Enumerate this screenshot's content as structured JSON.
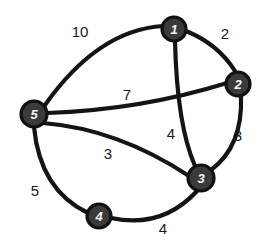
{
  "figure": {
    "background_color": "#ffffff",
    "node_fill_color": "#3a3a3a",
    "node_text_color": "#f2f2f2",
    "edge_color": "#141414",
    "label_color": "#1a1a1a"
  },
  "chart_data": {
    "type": "diagram",
    "title": "",
    "nodes": [
      {
        "id": "1",
        "label": "1",
        "x": 174,
        "y": 29,
        "r": 12
      },
      {
        "id": "2",
        "label": "2",
        "x": 238,
        "y": 84,
        "r": 12
      },
      {
        "id": "3",
        "label": "3",
        "x": 201,
        "y": 178,
        "r": 13
      },
      {
        "id": "4",
        "label": "4",
        "x": 99,
        "y": 216,
        "r": 12
      },
      {
        "id": "5",
        "label": "5",
        "x": 34,
        "y": 114,
        "r": 13
      }
    ],
    "edges": [
      {
        "id": "e-5-1",
        "source": "5",
        "target": "1",
        "weight": "10",
        "label_x": 80,
        "label_y": 31,
        "path": "M 45 105 Q 98 30 163 26"
      },
      {
        "id": "e-1-2",
        "source": "1",
        "target": "2",
        "weight": "2",
        "label_x": 225,
        "label_y": 33,
        "path": "M 186 31 Q 218 44 235 71"
      },
      {
        "id": "e-2-3",
        "source": "2",
        "target": "3",
        "weight": "3",
        "label_x": 238,
        "label_y": 135,
        "path": "M 241 96 Q 243 146 211 170"
      },
      {
        "id": "e-1-3",
        "source": "1",
        "target": "3",
        "weight": "4",
        "label_x": 171,
        "label_y": 133,
        "path": "M 175 41 Q 177 125 195 166"
      },
      {
        "id": "e-5-2",
        "source": "5",
        "target": "2",
        "weight": "7",
        "label_x": 127,
        "label_y": 94,
        "path": "M 47 113 Q 140 110 227 83"
      },
      {
        "id": "e-5-3",
        "source": "5",
        "target": "3",
        "weight": "3",
        "label_x": 108,
        "label_y": 153,
        "path": "M 43 123 Q 118 129 189 176"
      },
      {
        "id": "e-5-4",
        "source": "5",
        "target": "4",
        "weight": "5",
        "label_x": 35,
        "label_y": 190,
        "path": "M 34 127 Q 40 190 88 213"
      },
      {
        "id": "e-4-3",
        "source": "4",
        "target": "3",
        "weight": "4",
        "label_x": 163,
        "label_y": 228,
        "path": "M 111 218 Q 162 229 197 191"
      }
    ],
    "weights": {
      "5-1": 10,
      "1-2": 2,
      "2-3": 3,
      "1-3": 4,
      "5-2": 7,
      "5-3": 3,
      "5-4": 5,
      "4-3": 4
    }
  }
}
